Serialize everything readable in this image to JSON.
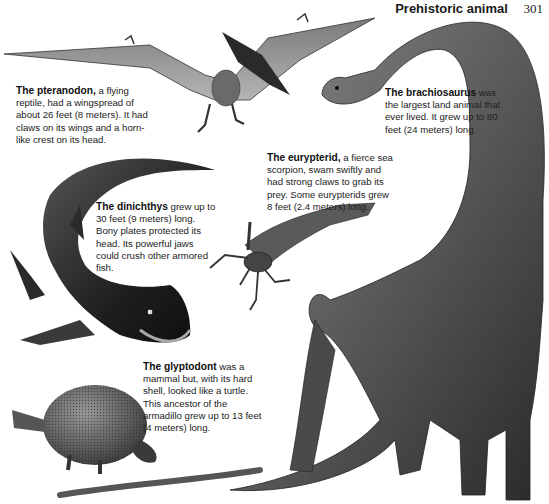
{
  "header": {
    "title": "Prehistoric animal",
    "page_number": "301"
  },
  "illustrations": [
    {
      "id": "pteranodon",
      "icon": "pteranodon-illustration"
    },
    {
      "id": "brachiosaurus",
      "icon": "brachiosaurus-illustration"
    },
    {
      "id": "dinichthys",
      "icon": "dinichthys-illustration"
    },
    {
      "id": "eurypterid",
      "icon": "eurypterid-illustration"
    },
    {
      "id": "glyptodont",
      "icon": "glyptodont-illustration"
    }
  ],
  "captions": {
    "pteranodon": {
      "name": "The pteranodon,",
      "text": " a flying reptile, had a wingspread of about 26 feet (8 meters). It had claws on its wings and a horn-like crest on its head."
    },
    "brachiosaurus": {
      "name": "The brachiosaurus",
      "text": " was the largest land animal that ever lived. It grew up to 80 feet (24 meters) long."
    },
    "eurypterid": {
      "name": "The eurypterid,",
      "text": " a fierce sea scorpion, swam swiftly and had strong claws to grab its prey. Some eurypterids grew 8 feet (2.4 meters) long."
    },
    "dinichthys": {
      "name": "The dinichthys",
      "text": " grew up to 30 feet (9 meters) long. Bony plates protected its head. Its powerful jaws could crush other armored fish."
    },
    "glyptodont": {
      "name": "The glyptodont",
      "text": " was a mammal but, with its hard shell, looked like a turtle. This ancestor of the armadillo grew up to 13 feet (4 meters) long."
    }
  }
}
